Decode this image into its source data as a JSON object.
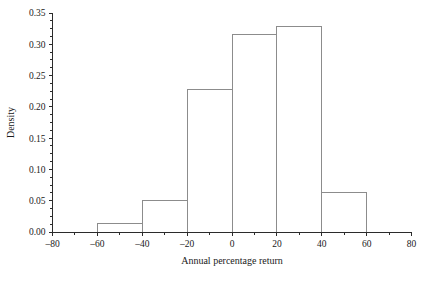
{
  "chart_data": {
    "type": "bar",
    "subtype": "histogram",
    "title": "",
    "xlabel": "Annual percentage return",
    "ylabel": "Density",
    "xlim": [
      -80,
      80
    ],
    "ylim": [
      0.0,
      0.35
    ],
    "grid": false,
    "legend": null,
    "bin_width": 20,
    "bin_edges": [
      -60,
      -40,
      -20,
      0,
      20,
      40,
      60
    ],
    "categories": [
      "-60 to -40",
      "-40 to -20",
      "-20 to 0",
      "0 to 20",
      "20 to 40",
      "40 to 60"
    ],
    "values": [
      0.013,
      0.05,
      0.227,
      0.316,
      0.329,
      0.0625
    ],
    "bars": [
      {
        "x0": -60,
        "x1": -40,
        "density": 0.013
      },
      {
        "x0": -40,
        "x1": -20,
        "density": 0.05
      },
      {
        "x0": -20,
        "x1": 0,
        "density": 0.227
      },
      {
        "x0": 0,
        "x1": 20,
        "density": 0.316
      },
      {
        "x0": 20,
        "x1": 40,
        "density": 0.329
      },
      {
        "x0": 40,
        "x1": 60,
        "density": 0.0625
      }
    ],
    "xticks": [
      -80,
      -60,
      -40,
      -20,
      0,
      20,
      40,
      60,
      80
    ],
    "xtick_labels": [
      "–80",
      "–60",
      "–40",
      "–20",
      "0",
      "20",
      "40",
      "60",
      "80"
    ],
    "yticks": [
      0.0,
      0.05,
      0.1,
      0.15,
      0.2,
      0.25,
      0.3,
      0.35
    ],
    "ytick_labels": [
      "0.00",
      "0.05",
      "0.10",
      "0.15",
      "0.20",
      "0.25",
      "0.30",
      "0.35"
    ],
    "y_minor_step": 0.0125,
    "x_minor_step": 10,
    "colors": {
      "background": "#ffffff",
      "axis": "#2b2b2b",
      "bar_edge": "#8c8c8c",
      "bar_fill": "none",
      "text": "#1a1a1a"
    }
  },
  "axes": {
    "x_title": "Annual percentage return",
    "y_title": "Density"
  }
}
